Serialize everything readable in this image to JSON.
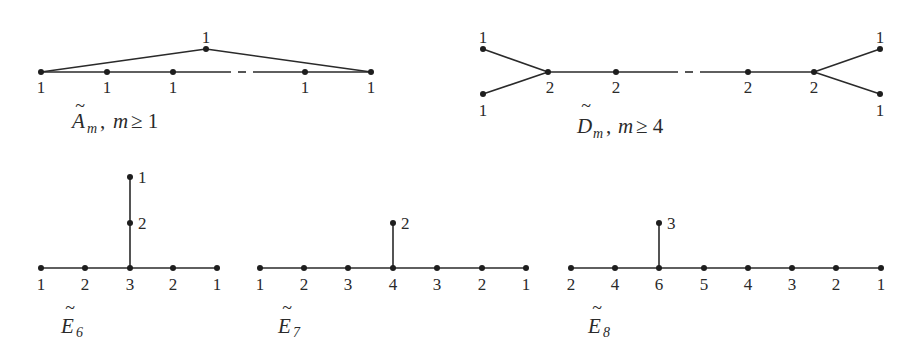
{
  "diagrams": {
    "A": {
      "letter": "A",
      "subscript": "m",
      "condition_sep": ",",
      "condition_var": "m",
      "condition": "≥ 1",
      "apex_label": "1",
      "labels": [
        "1",
        "1",
        "1",
        "1",
        "1"
      ]
    },
    "D": {
      "letter": "D",
      "subscript": "m",
      "condition_sep": ",",
      "condition_var": "m",
      "condition": "≥ 4",
      "leaf_labels": [
        "1",
        "1",
        "1",
        "1"
      ],
      "labels": [
        "2",
        "2",
        "2",
        "2"
      ]
    },
    "E6": {
      "letter": "E",
      "subscript": "6",
      "labels": [
        "1",
        "2",
        "3",
        "2",
        "1"
      ],
      "branch_labels": [
        "2",
        "1"
      ]
    },
    "E7": {
      "letter": "E",
      "subscript": "7",
      "labels": [
        "1",
        "2",
        "3",
        "4",
        "3",
        "2",
        "1"
      ],
      "branch_labels": [
        "2"
      ]
    },
    "E8": {
      "letter": "E",
      "subscript": "8",
      "labels": [
        "2",
        "4",
        "6",
        "5",
        "4",
        "3",
        "2",
        "1"
      ],
      "branch_labels": [
        "3"
      ]
    }
  },
  "tilde": "~"
}
